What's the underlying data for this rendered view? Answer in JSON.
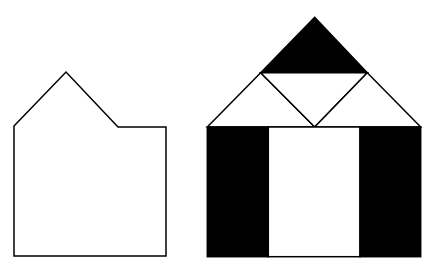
{
  "figure": {
    "width": 431,
    "height": 268,
    "background": "#ffffff",
    "stroke_color": "#000000",
    "fill_dark": "#000000",
    "fill_light": "#ffffff"
  },
  "left_shape": {
    "description": "House-shaped pentagon outline with asymmetric roof",
    "points": "14,126 66,72 118,127 166,127 166,256 14,256"
  },
  "right_shape": {
    "description": "House composed of tangram-like pieces",
    "roof_top_triangle": "314.7,17.3 260.7,72.7 367.3,72.7",
    "roof_left_triangle": "260.7,72.7 207.3,127 314.7,127",
    "roof_middle_triangle": "260.7,72.7 367.3,72.7 314.7,127",
    "roof_right_triangle": "367.3,72.7 314.7,127 420.7,127",
    "left_pillar": {
      "x": 207.3,
      "y": 127,
      "w": 61,
      "h": 129.7
    },
    "door": {
      "x": 268.3,
      "y": 127,
      "w": 91.7,
      "h": 129.7
    },
    "right_pillar": {
      "x": 360,
      "y": 127,
      "w": 60.7,
      "h": 129.7
    }
  }
}
